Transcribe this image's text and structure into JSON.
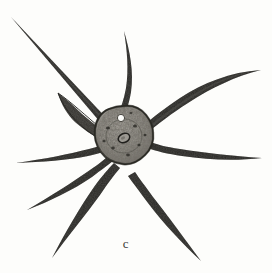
{
  "figure": {
    "label": "c",
    "background_color": "#fdfdfb",
    "ink_color": "#2b2a28",
    "width": 272,
    "height": 273
  },
  "organism": {
    "body": {
      "name": "cell-body",
      "center_x": 124,
      "center_y": 135,
      "radius_x": 28,
      "radius_y": 27,
      "fill_color": "#8c8983",
      "outline_color": "#2b2a28",
      "texture": "granular-stipple"
    },
    "nucleus": {
      "name": "nucleus",
      "center_x": 124,
      "center_y": 138,
      "radius_x": 6,
      "radius_y": 4.5,
      "rotation": -25,
      "outline_color": "#23221f",
      "fill_color": "#9a9790"
    },
    "vacuole": {
      "name": "contractile-vacuole",
      "center_x": 121,
      "center_y": 118,
      "radius": 3.6,
      "fill_color": "#fbfbf9",
      "outline_color": "#3a3935"
    },
    "axopodia": [
      {
        "name": "axopod-upper-left-long",
        "tip_x": 11,
        "tip_y": 17,
        "base_angle": 228,
        "curve": "straight",
        "length": 150,
        "thickness": 3.2
      },
      {
        "name": "axopod-upper-left-stub",
        "tip_x": 58,
        "tip_y": 93,
        "base_angle": 215,
        "curve": "stub-tapered",
        "length": 72,
        "thickness": 6.0
      },
      {
        "name": "axopod-top-curved",
        "tip_x": 124,
        "tip_y": 31,
        "base_angle": 278,
        "curve": "curve-right",
        "length": 108,
        "thickness": 3.0
      },
      {
        "name": "axopod-upper-right-curved",
        "tip_x": 261,
        "tip_y": 70,
        "base_angle": 330,
        "curve": "curve-up",
        "length": 158,
        "thickness": 3.4
      },
      {
        "name": "axopod-right",
        "tip_x": 262,
        "tip_y": 158,
        "base_angle": 8,
        "curve": "gentle-wave",
        "length": 140,
        "thickness": 3.6
      },
      {
        "name": "axopod-lower-right",
        "tip_x": 201,
        "tip_y": 261,
        "base_angle": 52,
        "curve": "straight",
        "length": 152,
        "thickness": 3.2
      },
      {
        "name": "axopod-lower-left-down",
        "tip_x": 52,
        "tip_y": 258,
        "base_angle": 120,
        "curve": "curve-left",
        "length": 148,
        "thickness": 3.2
      },
      {
        "name": "axopod-lower-left",
        "tip_x": 27,
        "tip_y": 210,
        "base_angle": 140,
        "curve": "curve-left",
        "length": 122,
        "thickness": 3.0
      },
      {
        "name": "axopod-left",
        "tip_x": 16,
        "tip_y": 163,
        "base_angle": 168,
        "curve": "gentle",
        "length": 110,
        "thickness": 3.0
      }
    ]
  }
}
